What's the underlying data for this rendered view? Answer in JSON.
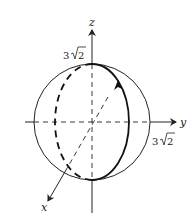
{
  "figure": {
    "type": "3d-sphere-with-great-circle",
    "axes": {
      "z": {
        "label": "z",
        "tick_label": "3√2",
        "tick_coef": "3",
        "tick_rad": "2"
      },
      "y": {
        "label": "y",
        "tick_label": "3√2",
        "tick_coef": "3",
        "tick_rad": "2"
      },
      "x": {
        "label": "x"
      }
    },
    "sphere": {
      "radius_label": "3√2"
    },
    "curve": {
      "description": "great circle in the xz-plane, oriented counterclockwise (arrow pointing up on the front side)"
    }
  },
  "colors": {
    "stroke": "#222222",
    "background": "#ffffff"
  }
}
